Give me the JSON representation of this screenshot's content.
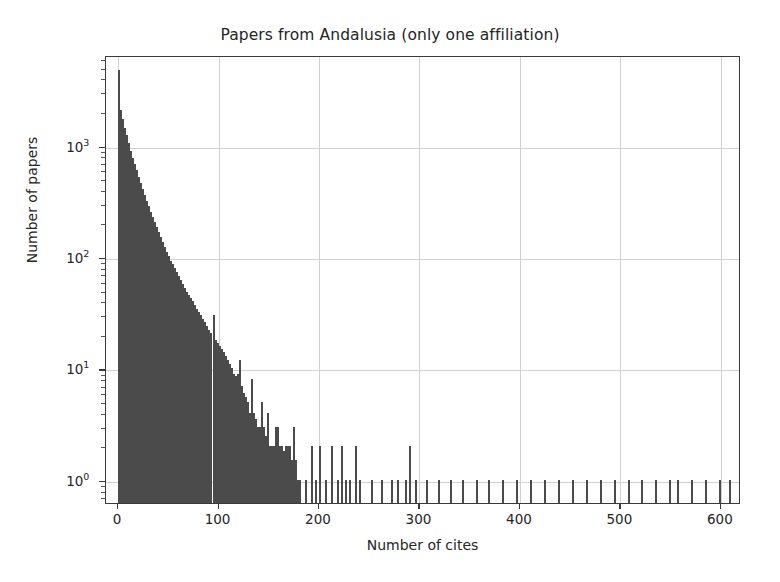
{
  "chart_data": {
    "type": "bar",
    "title": "Papers from Andalusia (only one affiliation)",
    "xlabel": "Number of cites",
    "ylabel": "Number of papers",
    "xlim": [
      -12,
      620
    ],
    "ylim_log": [
      0.62,
      6500
    ],
    "yscale": "log",
    "grid": true,
    "legend": "none",
    "bar_color": "#4b4b4b",
    "bin_width": 2,
    "xticks": [
      0,
      100,
      200,
      300,
      400,
      500,
      600
    ],
    "xtick_labels": [
      "0",
      "100",
      "200",
      "300",
      "400",
      "500",
      "600"
    ],
    "yticks": [
      1,
      10,
      100,
      1000
    ],
    "ytick_labels": [
      "10⁰",
      "10¹",
      "10²",
      "10³"
    ],
    "ytick_bases": [
      "10",
      "10",
      "10",
      "10"
    ],
    "ytick_exponents": [
      "0",
      "1",
      "2",
      "3"
    ],
    "x": [
      0,
      2,
      4,
      6,
      8,
      10,
      12,
      14,
      16,
      18,
      20,
      22,
      24,
      26,
      28,
      30,
      32,
      34,
      36,
      38,
      40,
      42,
      44,
      46,
      48,
      50,
      52,
      54,
      56,
      58,
      60,
      62,
      64,
      66,
      68,
      70,
      72,
      74,
      76,
      78,
      80,
      82,
      84,
      86,
      88,
      90,
      92,
      94,
      96,
      98,
      100,
      102,
      104,
      106,
      108,
      110,
      112,
      114,
      116,
      118,
      120,
      122,
      124,
      126,
      128,
      130,
      132,
      134,
      136,
      138,
      140,
      142,
      144,
      146,
      148,
      150,
      152,
      154,
      156,
      158,
      160,
      162,
      164,
      166,
      168,
      170,
      172,
      174,
      176,
      178,
      180,
      186,
      192,
      196,
      200,
      206,
      212,
      218,
      222,
      226,
      230,
      236,
      240,
      252,
      262,
      272,
      278,
      286,
      290,
      296,
      306,
      318,
      330,
      342,
      356,
      368,
      382,
      396,
      410,
      424,
      438,
      452,
      466,
      480,
      494,
      508,
      520,
      534,
      548,
      556,
      570,
      584,
      598,
      608
    ],
    "values": [
      4800,
      2100,
      1750,
      1450,
      1250,
      1050,
      900,
      780,
      680,
      600,
      520,
      460,
      410,
      360,
      320,
      285,
      255,
      230,
      205,
      185,
      168,
      150,
      136,
      124,
      112,
      102,
      93,
      86,
      80,
      74,
      68,
      62,
      57,
      53,
      49,
      46,
      43,
      40,
      37,
      34,
      32,
      30,
      28,
      26,
      24,
      22,
      21,
      30,
      18,
      17,
      16,
      15,
      14,
      13,
      12,
      11,
      10,
      9,
      8.5,
      9,
      12,
      7,
      6,
      5.5,
      5,
      4,
      8,
      4,
      3.5,
      3,
      3,
      5,
      3,
      2.5,
      4,
      2,
      2,
      2,
      3,
      3,
      2,
      2,
      1.8,
      2,
      2,
      2,
      1.5,
      3,
      1.5,
      1,
      1,
      1,
      2,
      1,
      2,
      1,
      2,
      1,
      2,
      1,
      1,
      2,
      1,
      1,
      1,
      1,
      1,
      1,
      2,
      1,
      1,
      1,
      1,
      1,
      1,
      1,
      1,
      1,
      1,
      1,
      1,
      1,
      1,
      1,
      1,
      1,
      1,
      1,
      1,
      1,
      1,
      1,
      1,
      1
    ]
  }
}
